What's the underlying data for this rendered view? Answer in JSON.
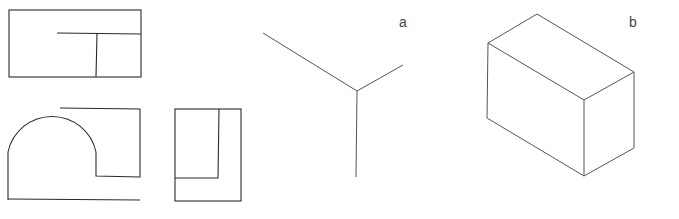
{
  "figure": {
    "views": [
      "top-view",
      "front-view",
      "side-view"
    ],
    "labels": {
      "a": "a",
      "b": "b"
    },
    "description_a": "isometric axes",
    "description_b": "isometric bounding box"
  }
}
